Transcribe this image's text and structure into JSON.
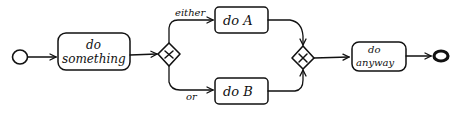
{
  "diagram": {
    "type": "bpmn-sketch",
    "colors": {
      "stroke": "#111111",
      "background": "#ffffff"
    },
    "start_event": {
      "name": "start"
    },
    "tasks": [
      {
        "id": "t1",
        "line1": "do",
        "line2": "something"
      },
      {
        "id": "t2",
        "line1": "do A"
      },
      {
        "id": "t3",
        "line1": "do B"
      },
      {
        "id": "t4",
        "line1": "do",
        "line2": "anyway"
      }
    ],
    "gateways": [
      {
        "id": "g1",
        "type": "exclusive",
        "symbol": "×"
      },
      {
        "id": "g2",
        "type": "exclusive",
        "symbol": "×"
      }
    ],
    "edge_labels": {
      "either": "either",
      "or": "or"
    },
    "end_event": {
      "name": "end"
    }
  }
}
